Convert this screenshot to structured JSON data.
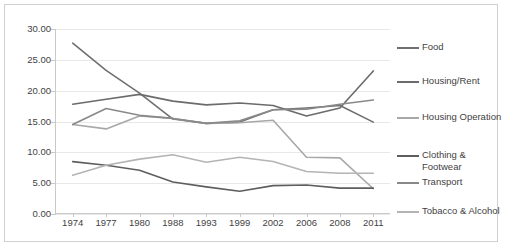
{
  "chart_data": {
    "type": "line",
    "title": "",
    "xlabel": "",
    "ylabel": "",
    "categories": [
      "1974",
      "1977",
      "1980",
      "1988",
      "1993",
      "1999",
      "2002",
      "2006",
      "2008",
      "2011"
    ],
    "ylim": [
      0.0,
      30.0
    ],
    "ytick_values": [
      0.0,
      5.0,
      10.0,
      15.0,
      20.0,
      25.0,
      30.0
    ],
    "ytick_labels": [
      "0.00",
      "5.00",
      "10.00",
      "15.00",
      "20.00",
      "25.00",
      "30.00"
    ],
    "grid": true,
    "legend_position": "right",
    "series": [
      {
        "name": "Food",
        "color": "#707070",
        "values": [
          27.7,
          23.3,
          19.6,
          15.4,
          14.7,
          14.9,
          16.9,
          17.2,
          17.6,
          14.9
        ]
      },
      {
        "name": "Housing/Rent",
        "color": "#6b6b6b",
        "values": [
          17.8,
          18.6,
          19.4,
          18.3,
          17.7,
          18.0,
          17.6,
          15.9,
          17.2,
          23.2
        ]
      },
      {
        "name": "Housing Operation",
        "color": "#a8a8a8",
        "values": [
          14.5,
          13.8,
          15.9,
          15.5,
          14.7,
          14.8,
          15.2,
          9.2,
          9.1,
          4.1
        ]
      },
      {
        "name": "Clothing & Footwear",
        "color": "#5e5e5e",
        "values": [
          8.5,
          7.9,
          7.1,
          5.2,
          4.4,
          3.7,
          4.6,
          4.7,
          4.2,
          4.2
        ]
      },
      {
        "name": "Transport",
        "color": "#898989",
        "values": [
          14.5,
          17.1,
          16.0,
          15.5,
          14.7,
          15.1,
          16.9,
          17.0,
          17.8,
          18.5
        ]
      },
      {
        "name": "Tobacco & Alcohol",
        "color": "#b4b4b4",
        "values": [
          6.3,
          7.9,
          8.9,
          9.6,
          8.4,
          9.2,
          8.5,
          6.9,
          6.6,
          6.6
        ]
      }
    ]
  },
  "legend": {
    "items": [
      {
        "label": "Food",
        "color": "#707070"
      },
      {
        "label": "Housing/Rent",
        "color": "#6b6b6b"
      },
      {
        "label": "Housing Operation",
        "color": "#a8a8a8"
      },
      {
        "label": "Clothing & Footwear",
        "color": "#5e5e5e"
      },
      {
        "label": "Transport",
        "color": "#898989"
      },
      {
        "label": "Tobacco & Alcohol",
        "color": "#b4b4b4"
      }
    ]
  }
}
